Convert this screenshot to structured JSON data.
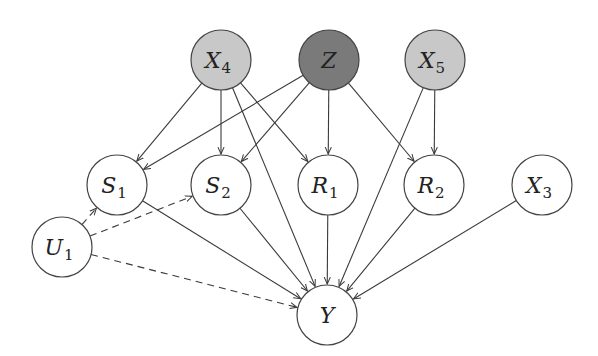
{
  "diagram": {
    "type": "causal-dag",
    "nodes": [
      {
        "id": "X4",
        "base": "X",
        "sub": "4",
        "x": 221,
        "y": 60,
        "r": 30,
        "fill": "#c8c8c8"
      },
      {
        "id": "Z",
        "base": "Z",
        "sub": "",
        "x": 329,
        "y": 60,
        "r": 30,
        "fill": "#7a7a7a"
      },
      {
        "id": "X5",
        "base": "X",
        "sub": "5",
        "x": 435,
        "y": 60,
        "r": 30,
        "fill": "#c8c8c8"
      },
      {
        "id": "S1",
        "base": "S",
        "sub": "1",
        "x": 117,
        "y": 185,
        "r": 30,
        "fill": "#ffffff"
      },
      {
        "id": "S2",
        "base": "S",
        "sub": "2",
        "x": 221,
        "y": 185,
        "r": 30,
        "fill": "#ffffff"
      },
      {
        "id": "R1",
        "base": "R",
        "sub": "1",
        "x": 328,
        "y": 185,
        "r": 30,
        "fill": "#ffffff"
      },
      {
        "id": "R2",
        "base": "R",
        "sub": "2",
        "x": 434,
        "y": 185,
        "r": 30,
        "fill": "#ffffff"
      },
      {
        "id": "X3",
        "base": "X",
        "sub": "3",
        "x": 542,
        "y": 185,
        "r": 30,
        "fill": "#ffffff"
      },
      {
        "id": "U1",
        "base": "U",
        "sub": "1",
        "x": 62,
        "y": 247,
        "r": 30,
        "fill": "#ffffff"
      },
      {
        "id": "Y",
        "base": "Y",
        "sub": "",
        "x": 327,
        "y": 315,
        "r": 30,
        "fill": "#ffffff"
      }
    ],
    "edges": [
      {
        "from": "X4",
        "to": "S1",
        "style": "solid"
      },
      {
        "from": "X4",
        "to": "S2",
        "style": "solid"
      },
      {
        "from": "X4",
        "to": "R1",
        "style": "solid"
      },
      {
        "from": "X4",
        "to": "Y",
        "style": "solid"
      },
      {
        "from": "Z",
        "to": "S1",
        "style": "solid"
      },
      {
        "from": "Z",
        "to": "S2",
        "style": "solid"
      },
      {
        "from": "Z",
        "to": "R1",
        "style": "solid"
      },
      {
        "from": "Z",
        "to": "R2",
        "style": "solid"
      },
      {
        "from": "X5",
        "to": "R2",
        "style": "solid"
      },
      {
        "from": "X5",
        "to": "Y",
        "style": "solid"
      },
      {
        "from": "S1",
        "to": "Y",
        "style": "solid"
      },
      {
        "from": "S2",
        "to": "Y",
        "style": "solid"
      },
      {
        "from": "R1",
        "to": "Y",
        "style": "solid"
      },
      {
        "from": "R2",
        "to": "Y",
        "style": "solid"
      },
      {
        "from": "X3",
        "to": "Y",
        "style": "solid"
      },
      {
        "from": "U1",
        "to": "S1",
        "style": "dashed"
      },
      {
        "from": "U1",
        "to": "S2",
        "style": "dashed"
      },
      {
        "from": "U1",
        "to": "Y",
        "style": "dashed"
      }
    ],
    "colors": {
      "stroke": "#444444",
      "edge": "#3a3a3a",
      "background": "#ffffff"
    }
  }
}
